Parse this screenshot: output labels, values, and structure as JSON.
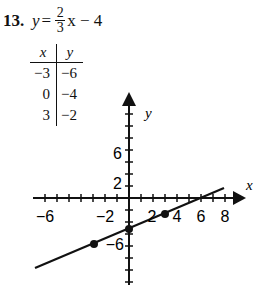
{
  "problem": {
    "number": "13.",
    "equation": {
      "lhs": "y",
      "eq": "=",
      "numerator": "2",
      "denominator": "3",
      "rhs": "x − 4"
    }
  },
  "table": {
    "headers": [
      "x",
      "y"
    ],
    "rows": [
      [
        "−3",
        "−6"
      ],
      [
        "0",
        "−4"
      ],
      [
        "3",
        "−2"
      ]
    ]
  },
  "graph": {
    "x_label": "x",
    "y_label": "y",
    "x_tick_labels": [
      "−6",
      "−2",
      "2",
      "4",
      "6",
      "8"
    ],
    "y_tick_labels": [
      "6",
      "2",
      "−6"
    ],
    "points": [
      [
        -3,
        -6
      ],
      [
        0,
        -4
      ],
      [
        3,
        -2
      ]
    ],
    "line": {
      "slope": "2/3",
      "intercept": -4
    }
  }
}
